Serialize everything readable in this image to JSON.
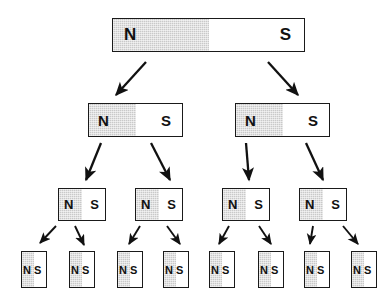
{
  "figure": {
    "width": 390,
    "height": 294,
    "background_color": "#ffffff",
    "north_fill_color": "#c9c9c9",
    "south_fill_color": "#ffffff",
    "outline_color": "#1a1a1a",
    "arrow_color": "#111111"
  },
  "labels": {
    "north": "N",
    "south": "S"
  },
  "rows": [
    {
      "level": 1,
      "count": 1,
      "magnets": [
        {
          "north": "N",
          "south": "S",
          "x": 112,
          "y": 18,
          "w": 193,
          "h": 34
        }
      ]
    },
    {
      "level": 2,
      "count": 2,
      "magnets": [
        {
          "north": "N",
          "south": "S",
          "x": 88,
          "y": 103,
          "w": 95,
          "h": 34
        },
        {
          "north": "N",
          "south": "S",
          "x": 235,
          "y": 103,
          "w": 95,
          "h": 34
        }
      ]
    },
    {
      "level": 3,
      "count": 4,
      "magnets": [
        {
          "north": "N",
          "south": "S",
          "x": 58,
          "y": 188,
          "w": 48,
          "h": 33
        },
        {
          "north": "N",
          "south": "S",
          "x": 135,
          "y": 188,
          "w": 48,
          "h": 33
        },
        {
          "north": "N",
          "south": "S",
          "x": 222,
          "y": 188,
          "w": 48,
          "h": 33
        },
        {
          "north": "N",
          "south": "S",
          "x": 299,
          "y": 188,
          "w": 48,
          "h": 33
        }
      ]
    },
    {
      "level": 4,
      "count": 8,
      "magnets": [
        {
          "north": "N",
          "south": "S",
          "x": 21,
          "y": 251,
          "w": 26,
          "h": 37
        },
        {
          "north": "N",
          "south": "S",
          "x": 69,
          "y": 251,
          "w": 26,
          "h": 37
        },
        {
          "north": "N",
          "south": "S",
          "x": 117,
          "y": 251,
          "w": 26,
          "h": 37
        },
        {
          "north": "N",
          "south": "S",
          "x": 163,
          "y": 251,
          "w": 26,
          "h": 37
        },
        {
          "north": "N",
          "south": "S",
          "x": 209,
          "y": 251,
          "w": 26,
          "h": 37
        },
        {
          "north": "N",
          "south": "S",
          "x": 258,
          "y": 251,
          "w": 26,
          "h": 37
        },
        {
          "north": "N",
          "south": "S",
          "x": 304,
          "y": 251,
          "w": 26,
          "h": 37
        },
        {
          "north": "N",
          "south": "S",
          "x": 351,
          "y": 251,
          "w": 26,
          "h": 37
        }
      ]
    }
  ],
  "arrows": [
    {
      "from_level": 1,
      "to_level": 2,
      "x1": 146,
      "y1": 62,
      "x2": 116,
      "y2": 95
    },
    {
      "from_level": 1,
      "to_level": 2,
      "x1": 268,
      "y1": 62,
      "x2": 298,
      "y2": 95
    },
    {
      "from_level": 2,
      "to_level": 3,
      "x1": 101,
      "y1": 143,
      "x2": 86,
      "y2": 180
    },
    {
      "from_level": 2,
      "to_level": 3,
      "x1": 151,
      "y1": 143,
      "x2": 170,
      "y2": 180
    },
    {
      "from_level": 2,
      "to_level": 3,
      "x1": 246,
      "y1": 143,
      "x2": 249,
      "y2": 180
    },
    {
      "from_level": 2,
      "to_level": 3,
      "x1": 306,
      "y1": 143,
      "x2": 323,
      "y2": 180
    },
    {
      "from_level": 3,
      "to_level": 4,
      "x1": 56,
      "y1": 226,
      "x2": 40,
      "y2": 243
    },
    {
      "from_level": 3,
      "to_level": 4,
      "x1": 75,
      "y1": 226,
      "x2": 84,
      "y2": 245
    },
    {
      "from_level": 3,
      "to_level": 4,
      "x1": 140,
      "y1": 226,
      "x2": 129,
      "y2": 244
    },
    {
      "from_level": 3,
      "to_level": 4,
      "x1": 167,
      "y1": 226,
      "x2": 180,
      "y2": 244
    },
    {
      "from_level": 3,
      "to_level": 4,
      "x1": 229,
      "y1": 226,
      "x2": 219,
      "y2": 244
    },
    {
      "from_level": 3,
      "to_level": 4,
      "x1": 259,
      "y1": 226,
      "x2": 271,
      "y2": 244
    },
    {
      "from_level": 3,
      "to_level": 4,
      "x1": 313,
      "y1": 226,
      "x2": 310,
      "y2": 244
    },
    {
      "from_level": 3,
      "to_level": 4,
      "x1": 343,
      "y1": 226,
      "x2": 358,
      "y2": 244
    }
  ]
}
